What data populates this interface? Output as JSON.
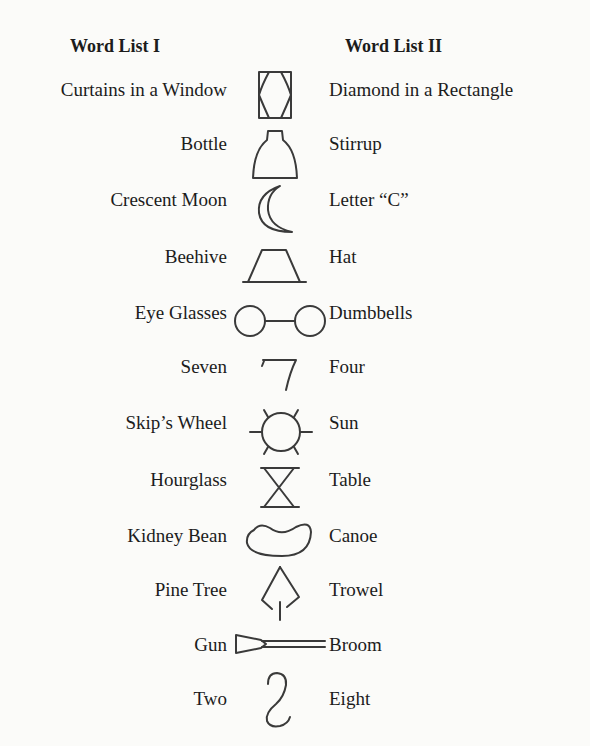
{
  "headers": {
    "list1": "Word List I",
    "list2": "Word List II"
  },
  "pairs": [
    {
      "list1": "Curtains in a Window",
      "figure": "window-curtains-figure",
      "list2": "Diamond in a Rectangle"
    },
    {
      "list1": "Bottle",
      "figure": "bottle-figure",
      "list2": "Stirrup"
    },
    {
      "list1": "Crescent Moon",
      "figure": "crescent-figure",
      "list2": "Letter “C”"
    },
    {
      "list1": "Beehive",
      "figure": "trapezoid-figure",
      "list2": "Hat"
    },
    {
      "list1": "Eye Glasses",
      "figure": "two-circles-figure",
      "list2": "Dumbbells"
    },
    {
      "list1": "Seven",
      "figure": "seven-figure",
      "list2": "Four"
    },
    {
      "list1": "Skip’s Wheel",
      "figure": "sun-wheel-figure",
      "list2": "Sun"
    },
    {
      "list1": "Hourglass",
      "figure": "hourglass-figure",
      "list2": "Table"
    },
    {
      "list1": "Kidney Bean",
      "figure": "bean-figure",
      "list2": "Canoe"
    },
    {
      "list1": "Pine Tree",
      "figure": "tree-trowel-figure",
      "list2": "Trowel"
    },
    {
      "list1": "Gun",
      "figure": "gun-broom-figure",
      "list2": "Broom"
    },
    {
      "list1": "Two",
      "figure": "two-eight-figure",
      "list2": "Eight"
    }
  ]
}
